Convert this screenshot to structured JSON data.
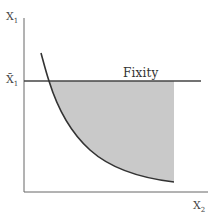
{
  "diagram": {
    "y_axis_label": "X",
    "y_axis_sub": "1",
    "x_axis_label": "X",
    "x_axis_sub": "2",
    "ybar_label": "X̄",
    "ybar_sub": "1",
    "line_label": "Fixity",
    "colors": {
      "axis": "#555555",
      "curve": "#333333",
      "shade": "#c9c9c9",
      "line": "#444444"
    }
  }
}
